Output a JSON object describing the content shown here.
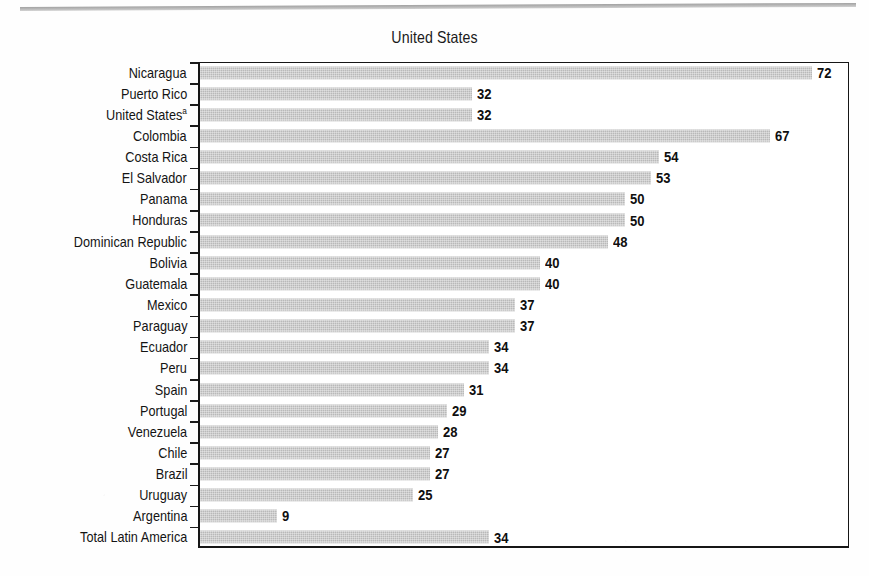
{
  "page": {
    "top_rule": "horizontal-rule",
    "background_color": "#fefefe"
  },
  "chart_data": {
    "type": "bar",
    "orientation": "horizontal",
    "title": "United States",
    "xlabel": "",
    "ylabel": "",
    "xlim": [
      0,
      76
    ],
    "grid": false,
    "legend": null,
    "bar_color": "#b9b9b9",
    "value_label_color": "#0f0f0f",
    "axis_color": "#161616",
    "categories": [
      "Nicaragua",
      "Puerto Rico",
      "United States",
      "Colombia",
      "Costa Rica",
      "El Salvador",
      "Panama",
      "Honduras",
      "Dominican Republic",
      "Bolivia",
      "Guatemala",
      "Mexico",
      "Paraguay",
      "Ecuador",
      "Peru",
      "Spain",
      "Portugal",
      "Venezuela",
      "Chile",
      "Brazil",
      "Uruguay",
      "Argentina",
      "Total Latin America"
    ],
    "values": [
      72,
      32,
      32,
      67,
      54,
      53,
      50,
      50,
      48,
      40,
      40,
      37,
      37,
      34,
      34,
      31,
      29,
      28,
      27,
      27,
      25,
      9,
      34
    ],
    "footnote_markers": {
      "United States": "a"
    }
  },
  "rows": [
    {
      "label": "Nicaragua",
      "sup": "",
      "value": 72,
      "value_text": "72"
    },
    {
      "label": "Puerto Rico",
      "sup": "",
      "value": 32,
      "value_text": "32"
    },
    {
      "label": "United States",
      "sup": "a",
      "value": 32,
      "value_text": "32"
    },
    {
      "label": "Colombia",
      "sup": "",
      "value": 67,
      "value_text": "67"
    },
    {
      "label": "Costa Rica",
      "sup": "",
      "value": 54,
      "value_text": "54"
    },
    {
      "label": "El Salvador",
      "sup": "",
      "value": 53,
      "value_text": "53"
    },
    {
      "label": "Panama",
      "sup": "",
      "value": 50,
      "value_text": "50"
    },
    {
      "label": "Honduras",
      "sup": "",
      "value": 50,
      "value_text": "50"
    },
    {
      "label": "Dominican Republic",
      "sup": "",
      "value": 48,
      "value_text": "48"
    },
    {
      "label": "Bolivia",
      "sup": "",
      "value": 40,
      "value_text": "40"
    },
    {
      "label": "Guatemala",
      "sup": "",
      "value": 40,
      "value_text": "40"
    },
    {
      "label": "Mexico",
      "sup": "",
      "value": 37,
      "value_text": "37"
    },
    {
      "label": "Paraguay",
      "sup": "",
      "value": 37,
      "value_text": "37"
    },
    {
      "label": "Ecuador",
      "sup": "",
      "value": 34,
      "value_text": "34"
    },
    {
      "label": "Peru",
      "sup": "",
      "value": 34,
      "value_text": "34"
    },
    {
      "label": "Spain",
      "sup": "",
      "value": 31,
      "value_text": "31"
    },
    {
      "label": "Portugal",
      "sup": "",
      "value": 29,
      "value_text": "29"
    },
    {
      "label": "Venezuela",
      "sup": "",
      "value": 28,
      "value_text": "28"
    },
    {
      "label": "Chile",
      "sup": "",
      "value": 27,
      "value_text": "27"
    },
    {
      "label": "Brazil",
      "sup": "",
      "value": 27,
      "value_text": "27"
    },
    {
      "label": "Uruguay",
      "sup": "",
      "value": 25,
      "value_text": "25"
    },
    {
      "label": "Argentina",
      "sup": "",
      "value": 9,
      "value_text": "9"
    },
    {
      "label": "Total Latin America",
      "sup": "",
      "value": 34,
      "value_text": "34"
    }
  ]
}
